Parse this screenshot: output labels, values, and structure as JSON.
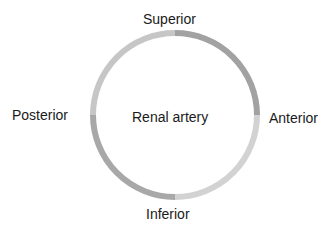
{
  "diagram": {
    "center_label": "Renal artery",
    "labels": {
      "top": "Superior",
      "right": "Anterior",
      "bottom": "Inferior",
      "left": "Posterior"
    },
    "ring": {
      "cx": 175,
      "cy": 115,
      "r": 82,
      "stroke_width": 6,
      "quadrant_colors": {
        "top_left": "#c6c6c6",
        "top_right": "#a2a2a2",
        "bottom_right": "#d2d2d2",
        "bottom_left": "#a8a8a8"
      }
    }
  }
}
